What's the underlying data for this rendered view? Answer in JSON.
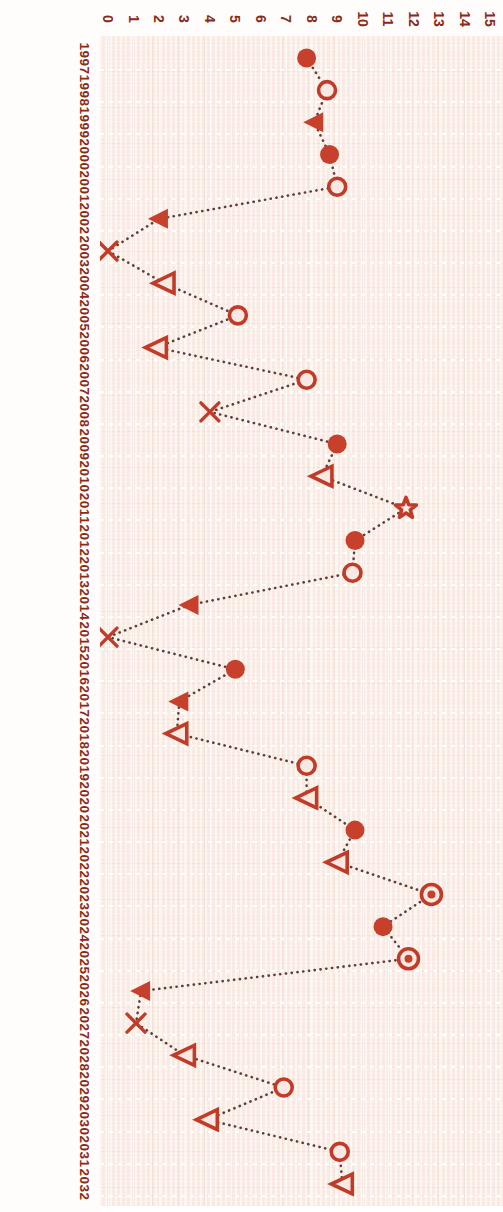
{
  "chart_data": {
    "type": "line",
    "orientation": "horizontal-rotated",
    "title": "",
    "xlabel": "",
    "ylabel": "",
    "xlim": [
      0,
      15
    ],
    "grid": true,
    "legend": false,
    "accent_color": "#c13b28",
    "background_color": "#f8eae2",
    "line_color": "#5b4038",
    "line_style": "dotted",
    "value_ticks": [
      "0",
      "1",
      "2",
      "3",
      "4",
      "5",
      "6",
      "7",
      "8",
      "9",
      "10",
      "11",
      "12",
      "13",
      "14",
      "15"
    ],
    "categories": [
      "1997",
      "1998",
      "1999",
      "2000",
      "2001",
      "2002",
      "2003",
      "2004",
      "2005",
      "2006",
      "2007",
      "2008",
      "2009",
      "2010",
      "2011",
      "2012",
      "2013",
      "2014",
      "2015",
      "2016",
      "2017",
      "2018",
      "2019",
      "2020",
      "2021",
      "2022",
      "2023",
      "2024",
      "2025",
      "2026",
      "2027",
      "2028",
      "2029",
      "2030",
      "2031",
      "2032"
    ],
    "values": [
      7.8,
      8.6,
      8.1,
      8.7,
      9.0,
      2.0,
      0.0,
      2.2,
      5.1,
      1.9,
      7.8,
      4.0,
      9.0,
      8.4,
      11.7,
      9.7,
      9.6,
      3.2,
      0.0,
      5.0,
      2.8,
      2.7,
      7.8,
      7.8,
      9.7,
      9.0,
      12.7,
      10.8,
      11.8,
      1.3,
      1.1,
      3.0,
      6.9,
      3.9,
      9.1,
      9.2
    ],
    "markers": [
      "filled-circle",
      "open-circle",
      "filled-triangle",
      "filled-circle",
      "open-circle",
      "filled-triangle",
      "x-cross",
      "open-triangle",
      "open-circle",
      "open-triangle",
      "open-circle",
      "x-cross",
      "filled-circle",
      "open-triangle",
      "star",
      "filled-circle",
      "open-circle",
      "filled-triangle",
      "x-cross",
      "filled-circle",
      "filled-triangle",
      "open-triangle",
      "open-circle",
      "open-triangle",
      "filled-circle",
      "open-triangle",
      "circled-dot",
      "filled-circle",
      "circled-dot",
      "filled-triangle",
      "x-cross",
      "open-triangle",
      "open-circle",
      "open-triangle",
      "open-circle",
      "open-triangle"
    ]
  }
}
